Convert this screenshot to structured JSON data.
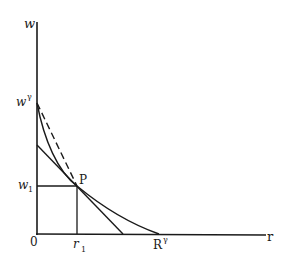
{
  "diagram": {
    "type": "economics-curve-diagram",
    "axes": {
      "y_label": "w",
      "x_label": "r",
      "origin_label": "0"
    },
    "labels": {
      "w_gamma": "w",
      "w_gamma_sup": "γ",
      "w1": "w",
      "w1_sub": "1",
      "point_p": "P",
      "r1": "r",
      "r1_sub": "1",
      "r_star": "R",
      "r_star_sup": "γ"
    },
    "elements": [
      {
        "name": "convex-curve",
        "description": "curve from w^γ on vertical axis through P to R^γ on horizontal axis"
      },
      {
        "name": "tangent-line",
        "description": "solid straight line tangent to curve at P"
      },
      {
        "name": "dashed-chord",
        "description": "dashed line from w^γ to P"
      },
      {
        "name": "w1-guide",
        "description": "horizontal line from w1 to P"
      },
      {
        "name": "r1-guide",
        "description": "vertical line from r1 to P"
      }
    ],
    "colors": {
      "ink": "#1a1a1a",
      "background": "#ffffff"
    }
  }
}
